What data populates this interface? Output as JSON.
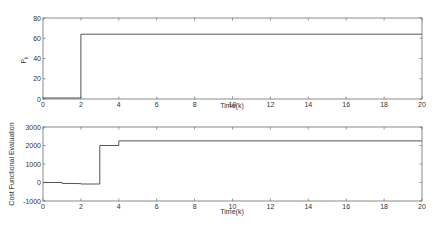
{
  "chart_data": [
    {
      "type": "line",
      "step": true,
      "title": "",
      "xlabel": "Time(k)",
      "ylabel": "P_k",
      "xlim": [
        0,
        20
      ],
      "ylim": [
        0,
        80
      ],
      "xticks": [
        0,
        2,
        4,
        6,
        8,
        10,
        12,
        14,
        16,
        18,
        20
      ],
      "yticks": [
        0,
        20,
        40,
        60,
        80
      ],
      "grid": false,
      "x": [
        0,
        2,
        2,
        20
      ],
      "values": [
        1,
        1,
        64,
        64
      ]
    },
    {
      "type": "line",
      "step": true,
      "title": "",
      "xlabel": "Time(k)",
      "ylabel": "Cost Functional Evaluation",
      "xlim": [
        0,
        20
      ],
      "ylim": [
        -1000,
        3000
      ],
      "xticks": [
        0,
        2,
        4,
        6,
        8,
        10,
        12,
        14,
        16,
        18,
        20
      ],
      "yticks": [
        -1000,
        0,
        1000,
        2000,
        3000
      ],
      "grid": false,
      "x": [
        0,
        1,
        1,
        2,
        2,
        3,
        3,
        4,
        4,
        20
      ],
      "values": [
        0,
        0,
        -50,
        -60,
        -80,
        -80,
        2000,
        2000,
        2250,
        2250
      ]
    }
  ],
  "labels": {
    "top_xlabel": "Time(k)",
    "top_ylabel_main": "P",
    "top_ylabel_sub": "k",
    "bottom_xlabel": "Time(k)",
    "bottom_ylabel": "Cost Functional Evaluation"
  }
}
